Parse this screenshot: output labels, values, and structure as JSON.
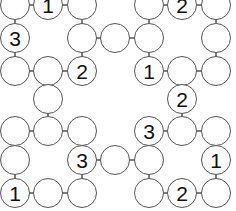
{
  "puzzle": {
    "type": "hashi-style circle grid",
    "col_x": [
      15,
      48,
      82,
      115,
      149,
      182,
      216
    ],
    "row_y": [
      5,
      38,
      71,
      99,
      131,
      160,
      193
    ],
    "line_color": "#555555",
    "nodes": [
      {
        "c": 0,
        "r": 0,
        "v": ""
      },
      {
        "c": 1,
        "r": 0,
        "v": "1"
      },
      {
        "c": 2,
        "r": 0,
        "v": ""
      },
      {
        "c": 4,
        "r": 0,
        "v": ""
      },
      {
        "c": 5,
        "r": 0,
        "v": "2"
      },
      {
        "c": 6,
        "r": 0,
        "v": ""
      },
      {
        "c": 0,
        "r": 1,
        "v": "3"
      },
      {
        "c": 2,
        "r": 1,
        "v": ""
      },
      {
        "c": 3,
        "r": 1,
        "v": ""
      },
      {
        "c": 4,
        "r": 1,
        "v": ""
      },
      {
        "c": 6,
        "r": 1,
        "v": ""
      },
      {
        "c": 0,
        "r": 2,
        "v": ""
      },
      {
        "c": 1,
        "r": 2,
        "v": ""
      },
      {
        "c": 2,
        "r": 2,
        "v": "2"
      },
      {
        "c": 4,
        "r": 2,
        "v": "1"
      },
      {
        "c": 5,
        "r": 2,
        "v": ""
      },
      {
        "c": 6,
        "r": 2,
        "v": ""
      },
      {
        "c": 1,
        "r": 3,
        "v": ""
      },
      {
        "c": 5,
        "r": 3,
        "v": "2"
      },
      {
        "c": 0,
        "r": 4,
        "v": ""
      },
      {
        "c": 1,
        "r": 4,
        "v": ""
      },
      {
        "c": 2,
        "r": 4,
        "v": ""
      },
      {
        "c": 4,
        "r": 4,
        "v": "3"
      },
      {
        "c": 5,
        "r": 4,
        "v": ""
      },
      {
        "c": 6,
        "r": 4,
        "v": ""
      },
      {
        "c": 0,
        "r": 5,
        "v": ""
      },
      {
        "c": 2,
        "r": 5,
        "v": "3"
      },
      {
        "c": 3,
        "r": 5,
        "v": ""
      },
      {
        "c": 4,
        "r": 5,
        "v": ""
      },
      {
        "c": 6,
        "r": 5,
        "v": "1"
      },
      {
        "c": 0,
        "r": 6,
        "v": "1"
      },
      {
        "c": 1,
        "r": 6,
        "v": ""
      },
      {
        "c": 2,
        "r": 6,
        "v": ""
      },
      {
        "c": 4,
        "r": 6,
        "v": ""
      },
      {
        "c": 5,
        "r": 6,
        "v": "2"
      },
      {
        "c": 6,
        "r": 6,
        "v": ""
      }
    ],
    "edges": [
      [
        [
          0,
          0
        ],
        [
          1,
          0
        ]
      ],
      [
        [
          1,
          0
        ],
        [
          2,
          0
        ]
      ],
      [
        [
          4,
          0
        ],
        [
          5,
          0
        ]
      ],
      [
        [
          5,
          0
        ],
        [
          6,
          0
        ]
      ],
      [
        [
          0,
          0
        ],
        [
          0,
          1
        ]
      ],
      [
        [
          0,
          1
        ],
        [
          0,
          2
        ]
      ],
      [
        [
          2,
          0
        ],
        [
          2,
          1
        ]
      ],
      [
        [
          2,
          1
        ],
        [
          2,
          2
        ]
      ],
      [
        [
          2,
          1
        ],
        [
          3,
          1
        ]
      ],
      [
        [
          3,
          1
        ],
        [
          4,
          1
        ]
      ],
      [
        [
          4,
          0
        ],
        [
          4,
          1
        ]
      ],
      [
        [
          4,
          1
        ],
        [
          4,
          2
        ]
      ],
      [
        [
          6,
          0
        ],
        [
          6,
          1
        ]
      ],
      [
        [
          6,
          1
        ],
        [
          6,
          2
        ]
      ],
      [
        [
          0,
          2
        ],
        [
          1,
          2
        ]
      ],
      [
        [
          1,
          2
        ],
        [
          2,
          2
        ]
      ],
      [
        [
          4,
          2
        ],
        [
          5,
          2
        ]
      ],
      [
        [
          5,
          2
        ],
        [
          6,
          2
        ]
      ],
      [
        [
          1,
          2
        ],
        [
          1,
          3
        ]
      ],
      [
        [
          1,
          3
        ],
        [
          1,
          4
        ]
      ],
      [
        [
          5,
          2
        ],
        [
          5,
          3
        ]
      ],
      [
        [
          5,
          3
        ],
        [
          5,
          4
        ]
      ],
      [
        [
          0,
          4
        ],
        [
          1,
          4
        ]
      ],
      [
        [
          1,
          4
        ],
        [
          2,
          4
        ]
      ],
      [
        [
          4,
          4
        ],
        [
          5,
          4
        ]
      ],
      [
        [
          5,
          4
        ],
        [
          6,
          4
        ]
      ],
      [
        [
          0,
          4
        ],
        [
          0,
          5
        ]
      ],
      [
        [
          0,
          5
        ],
        [
          0,
          6
        ]
      ],
      [
        [
          2,
          4
        ],
        [
          2,
          5
        ]
      ],
      [
        [
          2,
          5
        ],
        [
          2,
          6
        ]
      ],
      [
        [
          2,
          5
        ],
        [
          3,
          5
        ]
      ],
      [
        [
          3,
          5
        ],
        [
          4,
          5
        ]
      ],
      [
        [
          4,
          4
        ],
        [
          4,
          5
        ]
      ],
      [
        [
          4,
          5
        ],
        [
          4,
          6
        ]
      ],
      [
        [
          6,
          4
        ],
        [
          6,
          5
        ]
      ],
      [
        [
          6,
          5
        ],
        [
          6,
          6
        ]
      ],
      [
        [
          0,
          6
        ],
        [
          1,
          6
        ]
      ],
      [
        [
          1,
          6
        ],
        [
          2,
          6
        ]
      ],
      [
        [
          4,
          6
        ],
        [
          5,
          6
        ]
      ],
      [
        [
          5,
          6
        ],
        [
          6,
          6
        ]
      ]
    ]
  }
}
